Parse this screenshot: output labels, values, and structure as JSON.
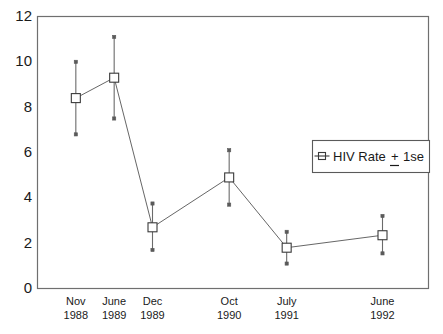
{
  "chart_data": {
    "type": "line",
    "title": "",
    "subtitle": "",
    "xlabel": "",
    "ylabel": "",
    "categories": [
      "Nov\n1988",
      "June\n1989",
      "Dec\n1989",
      "Oct\n1990",
      "July\n1991",
      "June\n1992"
    ],
    "x_tick_labels": [
      {
        "month": "Nov",
        "year": "1988"
      },
      {
        "month": "June",
        "year": "1989"
      },
      {
        "month": "Dec",
        "year": "1989"
      },
      {
        "month": "Oct",
        "year": "1990"
      },
      {
        "month": "July",
        "year": "1991"
      },
      {
        "month": "June",
        "year": "1992"
      }
    ],
    "x_positions": [
      1,
      2,
      3,
      5,
      6.5,
      9
    ],
    "xlim": [
      0,
      10.2
    ],
    "y_tick_labels": [
      "0",
      "2",
      "4",
      "6",
      "8",
      "10",
      "12"
    ],
    "y_ticks": [
      0,
      2,
      4,
      6,
      8,
      10,
      12
    ],
    "ylim": [
      0,
      12
    ],
    "grid": false,
    "legend_position": "right-middle",
    "series": [
      {
        "name": "HIV Rate",
        "marker": "open-square",
        "values": [
          8.4,
          9.3,
          2.7,
          4.9,
          1.8,
          2.35
        ],
        "err_low": [
          6.8,
          7.5,
          1.7,
          3.7,
          1.1,
          1.55
        ],
        "err_high": [
          10.0,
          11.1,
          3.75,
          6.1,
          2.5,
          3.2
        ],
        "error_type": "1 se"
      }
    ]
  },
  "legend": {
    "marker_name": "open-square-marker",
    "label_main": "HIV Rate",
    "label_pm": "+",
    "label_err": "1se"
  },
  "colors": {
    "frame": "#6f6f6f",
    "line": "#555555",
    "marker_stroke": "#3a3a3a",
    "marker_fill": "#ffffff",
    "error_bar": "#6b6b6b",
    "text": "#1a1a1a",
    "background": "#ffffff"
  }
}
